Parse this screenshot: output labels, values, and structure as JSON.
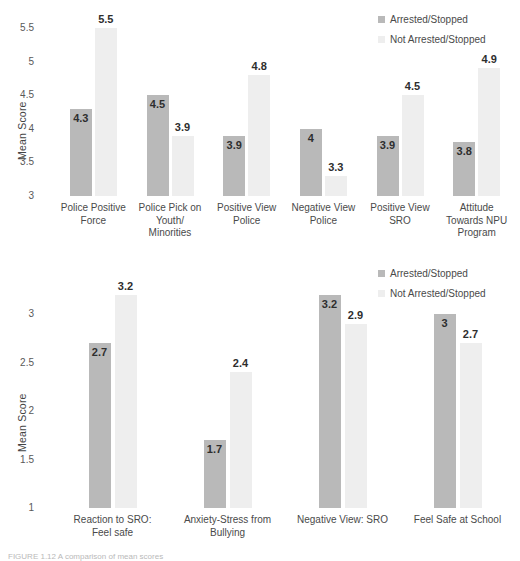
{
  "figure": {
    "caption": "FIGURE 1.12  A comparison of mean scores"
  },
  "legend": {
    "items": [
      {
        "label": "Arrested/Stopped",
        "color": "#b9b9b9",
        "key": "arrested"
      },
      {
        "label": "Not Arrested/Stopped",
        "color": "#eeeeee",
        "key": "not_arrested"
      }
    ]
  },
  "chart_data": [
    {
      "id": "top",
      "type": "bar",
      "title": "",
      "xlabel": "",
      "ylabel": "Mean Score",
      "ylim": [
        3,
        5.5
      ],
      "yticks": [
        3,
        3.5,
        4,
        4.5,
        5,
        5.5
      ],
      "ytick_labels": [
        "3",
        "3.5",
        "4",
        "4.5",
        "5",
        "5.5"
      ],
      "grid": false,
      "legend_position": "top-right",
      "categories": [
        "Police Positive\nForce",
        "Police Pick on\nYouth/\nMinorities",
        "Positive View\nPolice",
        "Negative View\nPolice",
        "Positive View\nSRO",
        "Attitude\nTowards NPU\nProgram"
      ],
      "series": [
        {
          "name": "Arrested/Stopped",
          "color": "#b9b9b9",
          "values": [
            4.3,
            4.5,
            3.9,
            4,
            3.9,
            3.8
          ],
          "labels": [
            "4.3",
            "4.5",
            "3.9",
            "4",
            "3.9",
            "3.8"
          ]
        },
        {
          "name": "Not Arrested/Stopped",
          "color": "#eeeeee",
          "values": [
            5.5,
            3.9,
            4.8,
            3.3,
            4.5,
            4.9
          ],
          "labels": [
            "5.5",
            "3.9",
            "4.8",
            "3.3",
            "4.5",
            "4.9"
          ]
        }
      ]
    },
    {
      "id": "bottom",
      "type": "bar",
      "title": "",
      "xlabel": "",
      "ylabel": "Mean Score",
      "ylim": [
        1,
        3.25
      ],
      "yticks": [
        1,
        1.5,
        2,
        2.5,
        3
      ],
      "ytick_labels": [
        "1",
        "1.5",
        "2",
        "2.5",
        "3"
      ],
      "grid": false,
      "legend_position": "top-right",
      "categories": [
        "Reaction to SRO:\nFeel safe",
        "Anxiety-Stress from\nBullying",
        "Negative View: SRO",
        "Feel Safe at School"
      ],
      "series": [
        {
          "name": "Arrested/Stopped",
          "color": "#b9b9b9",
          "values": [
            2.7,
            1.7,
            3.2,
            3
          ],
          "labels": [
            "2.7",
            "1.7",
            "3.2",
            "3"
          ]
        },
        {
          "name": "Not Arrested/Stopped",
          "color": "#eeeeee",
          "values": [
            3.2,
            2.4,
            2.9,
            2.7
          ],
          "labels": [
            "3.2",
            "2.4",
            "2.9",
            "2.7"
          ]
        }
      ]
    }
  ]
}
